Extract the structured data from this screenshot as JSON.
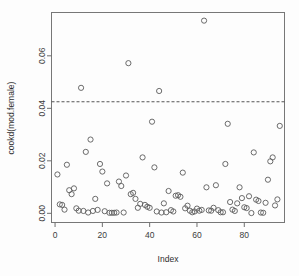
{
  "chart_data": {
    "type": "scatter",
    "title": "",
    "xlabel": "Index",
    "ylabel": "cookd(mod.female)",
    "xlim": [
      -1.5,
      97
    ],
    "ylim": [
      -0.0035,
      0.0765
    ],
    "xticks": [
      0,
      20,
      40,
      60,
      80
    ],
    "xticklabels": [
      "0",
      "20",
      "40",
      "60",
      "80"
    ],
    "yticks": [
      0.0,
      0.02,
      0.04,
      0.06
    ],
    "yticklabels": [
      "0.00",
      "0.02",
      "0.04",
      "0.06"
    ],
    "grid": false,
    "legend": null,
    "marker": "open-circle",
    "marker_size": 2.6,
    "threshold": {
      "value": 0.0425,
      "style": "dashed",
      "label": ""
    },
    "x": [
      1,
      2,
      3,
      4,
      5,
      6,
      7,
      8,
      9,
      10,
      11,
      12,
      13,
      14,
      15,
      16,
      17,
      18,
      19,
      20,
      21,
      22,
      23,
      24,
      25,
      26,
      27,
      28,
      29,
      30,
      31,
      32,
      33,
      34,
      35,
      36,
      37,
      38,
      39,
      40,
      41,
      42,
      43,
      44,
      45,
      46,
      47,
      48,
      49,
      50,
      51,
      52,
      53,
      54,
      55,
      56,
      57,
      58,
      59,
      60,
      61,
      62,
      63,
      64,
      65,
      66,
      67,
      68,
      69,
      70,
      71,
      72,
      73,
      74,
      75,
      76,
      77,
      78,
      79,
      80,
      81,
      82,
      83,
      84,
      85,
      86,
      87,
      88,
      89,
      90,
      91,
      92,
      93,
      94,
      95
    ],
    "y": [
      0.0148,
      0.0034,
      0.0032,
      0.0014,
      0.0185,
      0.0088,
      0.0073,
      0.0095,
      0.0019,
      0.001,
      0.0478,
      0.0009,
      0.0234,
      0.0003,
      0.0281,
      0.0009,
      0.0055,
      0.0013,
      0.0188,
      0.0159,
      0.0008,
      0.0114,
      0.0002,
      0.0002,
      0.0002,
      0.0003,
      0.0121,
      0.0104,
      0.0003,
      0.0144,
      0.0572,
      0.0073,
      0.0078,
      0.0055,
      0.0021,
      0.0036,
      0.0213,
      0.0032,
      0.0025,
      0.0021,
      0.0349,
      0.0175,
      0.0007,
      0.0466,
      0.0003,
      0.0038,
      0.0004,
      0.0085,
      0.0012,
      0.0007,
      0.0067,
      0.0069,
      0.0063,
      0.0155,
      0.0019,
      0.0029,
      0.001,
      0.0004,
      0.0007,
      0.0018,
      0.001,
      0.0013,
      0.0734,
      0.0099,
      0.0011,
      0.001,
      0.0021,
      0.0107,
      0.0012,
      0.0004,
      0.0004,
      0.0188,
      0.0341,
      0.0043,
      0.0014,
      0.0009,
      0.0038,
      0.0099,
      0.0058,
      0.0023,
      0.002,
      0.0065,
      0.0001,
      0.0232,
      0.0052,
      0.0047,
      0.0003,
      0.0002,
      0.004,
      0.0128,
      0.0198,
      0.0213,
      0.003,
      0.0053,
      0.0333
    ]
  }
}
